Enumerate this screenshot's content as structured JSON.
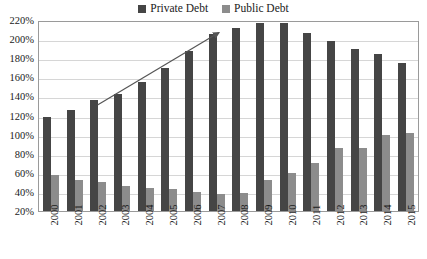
{
  "chart_data": {
    "type": "bar",
    "title": "",
    "subtitle": "",
    "xlabel": "",
    "ylabel": "",
    "ylim": [
      20,
      220
    ],
    "ytick_labels": [
      "220%",
      "200%",
      "180%",
      "160%",
      "140%",
      "120%",
      "100%",
      "80%",
      "60%",
      "40%",
      "20%"
    ],
    "ytick_values": [
      220,
      200,
      180,
      160,
      140,
      120,
      100,
      80,
      60,
      40,
      20
    ],
    "grid": true,
    "legend_position": "top-center",
    "categories": [
      "2000",
      "2001",
      "2002",
      "2003",
      "2004",
      "2005",
      "2006",
      "2007",
      "2008",
      "2009",
      "2010",
      "2011",
      "2012",
      "2013",
      "2014",
      "2015"
    ],
    "series": [
      {
        "name": "Private Debt",
        "color": "#454545",
        "values": [
          118,
          126,
          136,
          143,
          155,
          170,
          188,
          205,
          212,
          217,
          217,
          206,
          198,
          190,
          184,
          175
        ]
      },
      {
        "name": "Public Debt",
        "color": "#8c8c8c",
        "values": [
          58,
          52,
          50,
          46,
          44,
          43,
          40,
          38,
          39,
          52,
          60,
          70,
          86,
          86,
          100,
          102
        ]
      }
    ],
    "annotations": [
      {
        "name": "rising-trend-arrow",
        "type": "arrow",
        "from_category": "2002",
        "to_category": "2007",
        "from_value": 132,
        "to_value": 208,
        "color": "#555555"
      }
    ]
  },
  "legend": {
    "entries": [
      {
        "label": "Private Debt",
        "color": "#454545",
        "swatch_icon": "square-swatch-icon"
      },
      {
        "label": "Public Debt",
        "color": "#8c8c8c",
        "swatch_icon": "square-swatch-icon"
      }
    ]
  }
}
